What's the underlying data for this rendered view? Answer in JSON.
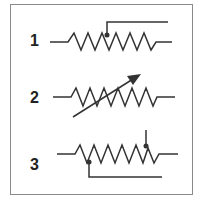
{
  "diagram": {
    "colors": {
      "stroke": "#333333",
      "frame": "#8a8a8a",
      "background": "#ffffff"
    },
    "symbols": [
      {
        "number": "1",
        "type": "potentiometer-with-top-wiper"
      },
      {
        "number": "2",
        "type": "variable-resistor-with-arrow"
      },
      {
        "number": "3",
        "type": "resistor-with-two-taps"
      }
    ]
  }
}
